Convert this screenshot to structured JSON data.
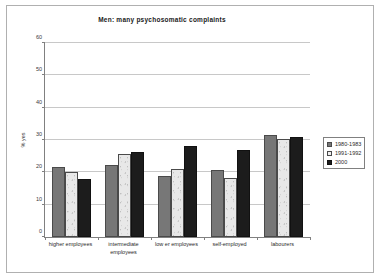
{
  "chart_data": {
    "type": "bar",
    "title": "Men: many psychosomatic complaints",
    "xlabel": "",
    "ylabel": "% yes",
    "categories": [
      "higher employees",
      "intermediate employees",
      "low er employees",
      "self-employed",
      "labourers"
    ],
    "series": [
      {
        "name": "1980-1983",
        "color": "#777777",
        "values": [
          21.5,
          22.2,
          19.0,
          20.8,
          31.6
        ]
      },
      {
        "name": "1991-1992",
        "color": "#e8e8e8",
        "values": [
          20.2,
          25.8,
          20.9,
          18.4,
          30.4
        ]
      },
      {
        "name": "2000",
        "color": "#1c1c1c",
        "values": [
          17.8,
          26.2,
          28.2,
          26.8,
          30.9
        ]
      }
    ],
    "ylim": [
      0,
      60
    ],
    "yticks": [
      0,
      10,
      20,
      30,
      40,
      50,
      60
    ],
    "ytick_labels": [
      "0",
      "10",
      "20",
      "30",
      "40",
      "50",
      "60"
    ],
    "grid": true,
    "legend_position": "right"
  },
  "legend": {
    "items": [
      {
        "label": "1980-1983"
      },
      {
        "label": "1991-1992"
      },
      {
        "label": "2000"
      }
    ]
  }
}
